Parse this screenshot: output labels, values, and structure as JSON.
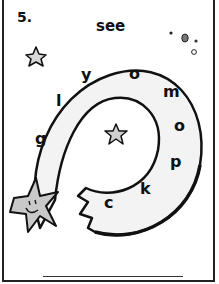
{
  "worksheet": {
    "item_number": "5.",
    "target_word": "see",
    "spiral_letters": [
      {
        "char": "y",
        "x": 81,
        "y": 67
      },
      {
        "char": "o",
        "x": 129,
        "y": 66
      },
      {
        "char": "l",
        "x": 56,
        "y": 93
      },
      {
        "char": "m",
        "x": 163,
        "y": 84
      },
      {
        "char": "g",
        "x": 35,
        "y": 131
      },
      {
        "char": "o",
        "x": 174,
        "y": 118
      },
      {
        "char": "p",
        "x": 170,
        "y": 154
      },
      {
        "char": "k",
        "x": 140,
        "y": 181
      },
      {
        "char": "c",
        "x": 104,
        "y": 195
      }
    ],
    "answer_line_value": "",
    "colors": {
      "ink": "#111111",
      "spiral_fill": "#f3f3f3",
      "star_fill": "#c9c9c9",
      "background": "#ffffff"
    },
    "icons": [
      "star-outline-icon",
      "shooting-star-face-icon",
      "center-star-icon",
      "dots-cluster-icon"
    ]
  }
}
